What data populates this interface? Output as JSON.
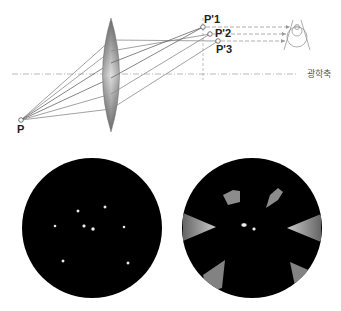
{
  "diagram": {
    "labels": {
      "object_point": "P",
      "image_point_1": "P'1",
      "image_point_2": "P'2",
      "image_point_3": "P'3",
      "optical_axis": "광학축"
    },
    "colors": {
      "background": "#ffffff",
      "ray": "#8a8a8a",
      "ray_dark": "#6a6a6a",
      "dashed": "#9a9a9a",
      "lens_edge": "#5a5a5a",
      "lens_center": "#d8d8d8",
      "field_bg": "#000000",
      "star": "#e8e8e8"
    },
    "geometry": {
      "object_point": {
        "x": 21,
        "y": 120
      },
      "image_points": [
        {
          "id": "P'1",
          "x": 203,
          "y": 27
        },
        {
          "id": "P'2",
          "x": 210,
          "y": 34
        },
        {
          "id": "P'3",
          "x": 218,
          "y": 41
        }
      ],
      "lens": {
        "cx": 111,
        "top": 18,
        "bottom": 132,
        "half_width": 8.5
      },
      "optical_axis_y": 74,
      "image_plane_x": 203
    },
    "panels": [
      {
        "name": "sharp-star-field",
        "cx": 92,
        "cy": 228,
        "r": 70,
        "stars": [
          {
            "x": 78,
            "y": 211
          },
          {
            "x": 105,
            "y": 207
          },
          {
            "x": 55,
            "y": 226
          },
          {
            "x": 84,
            "y": 226
          },
          {
            "x": 93,
            "y": 229
          },
          {
            "x": 124,
            "y": 227
          },
          {
            "x": 63,
            "y": 261
          },
          {
            "x": 128,
            "y": 263
          }
        ]
      },
      {
        "name": "coma-star-field",
        "cx": 252,
        "cy": 228,
        "r": 70,
        "center_stars": [
          {
            "x": 244,
            "y": 225
          },
          {
            "x": 254,
            "y": 229
          }
        ]
      }
    ]
  }
}
